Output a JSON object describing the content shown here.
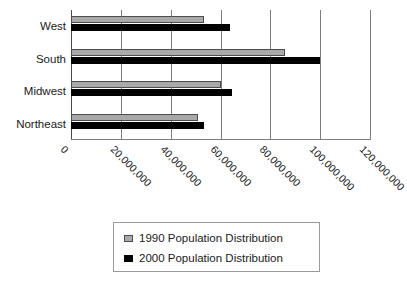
{
  "chart_data": {
    "type": "bar",
    "orientation": "horizontal",
    "title": "",
    "xlabel": "",
    "ylabel": "",
    "categories": [
      "West",
      "South",
      "Midwest",
      "Northeast"
    ],
    "series": [
      {
        "name": "1990 Population Distribution",
        "color": "#a9a9a9",
        "values": [
          53500000,
          86000000,
          60000000,
          51000000
        ]
      },
      {
        "name": "2000 Population Distribution",
        "color": "#000000",
        "values": [
          64000000,
          100000000,
          64500000,
          53500000
        ]
      }
    ],
    "xlim": [
      0,
      120000000
    ],
    "xticks": [
      0,
      20000000,
      40000000,
      60000000,
      80000000,
      100000000,
      120000000
    ],
    "xtick_labels": [
      "0",
      "20,000,000",
      "40,000,000",
      "60,000,000",
      "80,000,000",
      "100,000,000",
      "120,000,000"
    ],
    "grid": true,
    "grid_axis": "x",
    "legend_position": "bottom-center",
    "legend": [
      "1990 Population Distribution",
      "2000 Population Distribution"
    ]
  }
}
